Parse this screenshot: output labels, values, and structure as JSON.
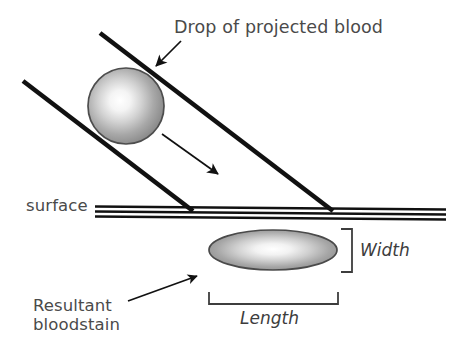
{
  "figure": {
    "kind": "forensic-diagram",
    "background_color": "#ffffff",
    "ink_color": "#1a1a1a",
    "text_color": "#4a4a4a"
  },
  "labels": {
    "title": "Drop of projected blood",
    "surface": "surface",
    "resultant_line1": "Resultant",
    "resultant_line2": "bloodstain",
    "width": "Width",
    "length": "Length"
  },
  "shapes": {
    "droplet": {
      "name": "blood-droplet-sphere",
      "cx": 126,
      "cy": 106,
      "r": 38,
      "fill_center": "#fdfdfd",
      "fill_edge": "#8e8e8e",
      "stroke": "#4d4d4d"
    },
    "bloodstain": {
      "name": "resultant-bloodstain-ellipse",
      "cx": 273,
      "cy": 250,
      "rx": 64,
      "ry": 20,
      "fill_center": "#fbfbfb",
      "fill_edge": "#8d8d8d",
      "stroke": "#4a4a4a"
    },
    "surface": {
      "name": "surface-band",
      "x1": 95,
      "x2": 446,
      "lines_y": [
        207,
        211.5,
        216
      ],
      "stroke": "#111111"
    },
    "trajectory_upper": {
      "name": "trajectory-line-upper",
      "x1": 100,
      "y1": 33,
      "x2": 333,
      "y2": 211
    },
    "trajectory_lower": {
      "name": "trajectory-line-lower",
      "x1": 23,
      "y1": 81,
      "x2": 193,
      "y2": 211
    },
    "motion_arrow": {
      "name": "motion-direction-arrow",
      "x1": 162,
      "y1": 134,
      "x2": 223,
      "y2": 178
    },
    "title_arrow": {
      "name": "title-pointer-arrow",
      "x1": 180,
      "y1": 42,
      "x2": 152,
      "y2": 70
    },
    "resultant_arrow": {
      "name": "resultant-pointer-arrow",
      "x1": 128,
      "y1": 301,
      "x2": 201,
      "y2": 274
    },
    "width_bracket": {
      "name": "width-dimension-bracket",
      "x": 352,
      "y_top": 229,
      "y_bottom": 272,
      "tick": 11
    },
    "length_bracket": {
      "name": "length-dimension-bracket",
      "x_left": 209,
      "x_right": 338,
      "y": 304,
      "tick": 12
    }
  }
}
